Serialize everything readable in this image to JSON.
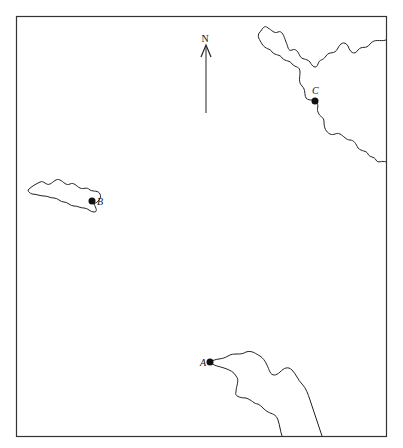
{
  "map": {
    "north_label": "N",
    "points": [
      {
        "id": "A",
        "label": "A"
      },
      {
        "id": "B",
        "label": "B"
      },
      {
        "id": "C",
        "label": "C"
      }
    ]
  }
}
